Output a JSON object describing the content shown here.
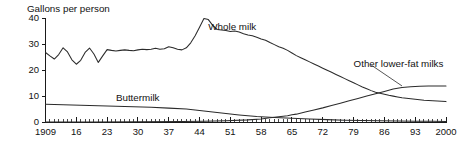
{
  "chart_data": {
    "type": "line",
    "title": "Gallons per person",
    "xlabel": "",
    "ylabel": "",
    "ylim": [
      0,
      40
    ],
    "xlim": [
      1909,
      2000
    ],
    "grid": false,
    "legend_position": "inline-labels",
    "ytick_labels": [
      "0",
      "10",
      "20",
      "30",
      "40"
    ],
    "ytick_values": [
      0,
      10,
      20,
      30,
      40
    ],
    "xtick_labels": [
      "1909",
      "16",
      "23",
      "30",
      "37",
      "44",
      "51",
      "58",
      "65",
      "72",
      "79",
      "86",
      "93",
      "2000"
    ],
    "xtick_values": [
      1909,
      1916,
      1923,
      1930,
      1937,
      1944,
      1951,
      1958,
      1965,
      1972,
      1979,
      1986,
      1993,
      2000
    ],
    "minor_tick_interval": 1,
    "annotations": [
      {
        "text": "Whole milk",
        "x": 1946,
        "y": 38,
        "leader": false
      },
      {
        "text": "Buttermilk",
        "x": 1925,
        "y": 11,
        "leader": false
      },
      {
        "text": "Other lower-fat milks",
        "x": 1979,
        "y": 24,
        "leader": true,
        "leader_from_x": 1983,
        "leader_from_y": 22,
        "leader_to_x": 1990,
        "leader_to_y": 14
      }
    ],
    "series": [
      {
        "name": "Whole milk",
        "color": "#2b2b2b",
        "x": [
          1909,
          1910,
          1911,
          1912,
          1913,
          1914,
          1915,
          1916,
          1917,
          1918,
          1919,
          1920,
          1921,
          1922,
          1923,
          1924,
          1925,
          1926,
          1927,
          1928,
          1929,
          1930,
          1931,
          1932,
          1933,
          1934,
          1935,
          1936,
          1937,
          1938,
          1939,
          1940,
          1941,
          1942,
          1943,
          1944,
          1945,
          1946,
          1947,
          1948,
          1949,
          1950,
          1951,
          1952,
          1953,
          1954,
          1955,
          1956,
          1957,
          1958,
          1959,
          1960,
          1961,
          1962,
          1963,
          1964,
          1965,
          1966,
          1967,
          1968,
          1969,
          1970,
          1971,
          1972,
          1973,
          1974,
          1975,
          1976,
          1977,
          1978,
          1979,
          1980,
          1981,
          1982,
          1983,
          1984,
          1985,
          1986,
          1987,
          1988,
          1989,
          1990,
          1991,
          1992,
          1993,
          1994,
          1995,
          1996,
          1997,
          1998,
          1999,
          2000
        ],
        "values": [
          26.8,
          25.5,
          24.3,
          26.0,
          28.6,
          27.0,
          24.0,
          22.3,
          23.8,
          26.8,
          28.5,
          26.2,
          23.0,
          25.5,
          27.9,
          27.6,
          27.4,
          27.6,
          27.8,
          27.6,
          27.5,
          27.8,
          28.0,
          27.9,
          28.0,
          28.4,
          28.0,
          28.2,
          29.0,
          28.6,
          28.0,
          27.8,
          28.6,
          30.5,
          33.2,
          36.5,
          39.8,
          39.4,
          37.2,
          35.6,
          35.4,
          35.2,
          34.8,
          35.0,
          34.6,
          34.0,
          33.5,
          33.2,
          32.6,
          32.0,
          31.5,
          30.6,
          29.8,
          29.0,
          28.4,
          27.6,
          26.6,
          25.6,
          24.8,
          24.0,
          23.2,
          22.4,
          21.6,
          20.8,
          20.0,
          19.2,
          18.4,
          17.6,
          16.8,
          16.0,
          15.2,
          14.4,
          13.6,
          12.9,
          12.2,
          11.6,
          11.2,
          10.8,
          10.4,
          10.1,
          9.8,
          9.5,
          9.3,
          9.1,
          8.9,
          8.7,
          8.5,
          8.4,
          8.3,
          8.2,
          8.1,
          8.0
        ]
      },
      {
        "name": "Buttermilk",
        "color": "#2b2b2b",
        "x": [
          1909,
          1913,
          1917,
          1921,
          1925,
          1929,
          1933,
          1937,
          1941,
          1945,
          1949,
          1953,
          1957,
          1961,
          1965,
          1969,
          1973,
          1977,
          1981,
          1985,
          1989,
          1993,
          1997,
          2000
        ],
        "values": [
          7.0,
          6.8,
          6.6,
          6.4,
          6.2,
          6.0,
          5.8,
          5.5,
          5.2,
          4.4,
          3.6,
          2.9,
          2.3,
          1.9,
          1.6,
          1.3,
          1.1,
          0.9,
          0.8,
          0.7,
          0.6,
          0.5,
          0.5,
          0.4
        ]
      },
      {
        "name": "Other lower-fat milks",
        "color": "#2b2b2b",
        "x": [
          1909,
          1920,
          1930,
          1940,
          1945,
          1950,
          1955,
          1958,
          1960,
          1962,
          1964,
          1965,
          1966,
          1968,
          1970,
          1972,
          1974,
          1976,
          1978,
          1980,
          1982,
          1984,
          1986,
          1988,
          1990,
          1992,
          1994,
          1996,
          1998,
          2000
        ],
        "values": [
          0.2,
          0.2,
          0.3,
          0.4,
          0.5,
          0.7,
          1.0,
          1.3,
          1.8,
          2.2,
          2.6,
          3.0,
          3.2,
          4.0,
          4.8,
          5.6,
          6.5,
          7.4,
          8.3,
          9.2,
          10.1,
          11.0,
          11.9,
          12.8,
          13.4,
          13.7,
          13.9,
          14.0,
          14.0,
          14.0
        ]
      }
    ]
  }
}
